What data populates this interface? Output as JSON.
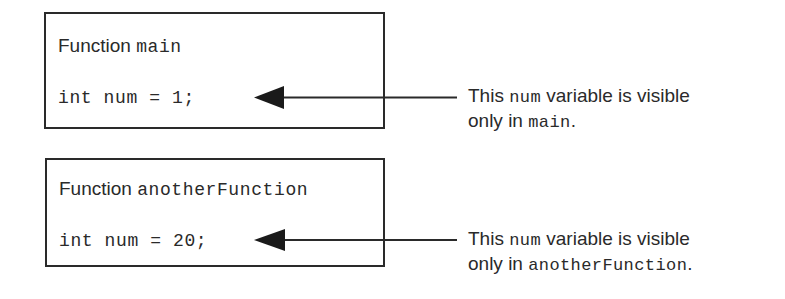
{
  "diagram": {
    "blocks": [
      {
        "keyword": "Function",
        "function_name": "main",
        "declaration": "int num = 1;",
        "note": {
          "line1_prefix": "This",
          "line1_code": "num",
          "line1_suffix": "variable is visible",
          "line2_prefix": "only in",
          "line2_code": "main",
          "line2_suffix": "."
        }
      },
      {
        "keyword": "Function",
        "function_name": "anotherFunction",
        "declaration": "int num = 20;",
        "note": {
          "line1_prefix": "This",
          "line1_code": "num",
          "line1_suffix": "variable is visible",
          "line2_prefix": "only in",
          "line2_code": "anotherFunction",
          "line2_suffix": "."
        }
      }
    ],
    "colors": {
      "ink": "#2a2a2a",
      "background": "#ffffff"
    }
  }
}
